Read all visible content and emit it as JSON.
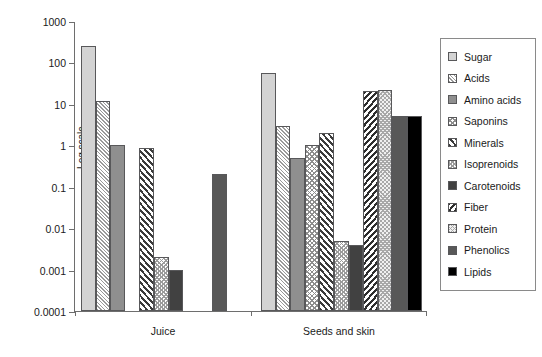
{
  "chart_data": {
    "type": "bar",
    "title": "",
    "xlabel": "",
    "ylabel": "Log scale",
    "y_scale": "log",
    "ylim": [
      0.0001,
      1000
    ],
    "y_ticks": [
      "1000",
      "100",
      "10",
      "1",
      "0.1",
      "0.01",
      "0.001",
      "0.0001"
    ],
    "y_tick_values": [
      1000,
      100,
      10,
      1,
      0.1,
      0.01,
      0.001,
      0.0001
    ],
    "grid": false,
    "legend_position": "right",
    "categories": [
      "Juice",
      "Seeds and skin"
    ],
    "series": [
      {
        "name": "Sugar",
        "pattern": "solid-light-gray",
        "values": [
          250,
          55
        ]
      },
      {
        "name": "Acids",
        "pattern": "fine-diagonal-hatch",
        "values": [
          12,
          3
        ]
      },
      {
        "name": "Amino acids",
        "pattern": "solid-medium-gray",
        "values": [
          1.0,
          0.5
        ]
      },
      {
        "name": "Saponins",
        "pattern": "fine-crosshatch",
        "values": [
          null,
          1.0
        ]
      },
      {
        "name": "Minerals",
        "pattern": "bold-diagonal-hatch",
        "values": [
          0.85,
          2.0
        ]
      },
      {
        "name": "Isoprenoids",
        "pattern": "light-crosshatch",
        "values": [
          0.002,
          0.005
        ]
      },
      {
        "name": "Carotenoids",
        "pattern": "solid-dark-gray",
        "values": [
          0.001,
          0.004
        ]
      },
      {
        "name": "Fiber",
        "pattern": "bold-back-hatch",
        "values": [
          null,
          20
        ]
      },
      {
        "name": "Protein",
        "pattern": "pale-crosshatch",
        "values": [
          null,
          22
        ]
      },
      {
        "name": "Phenolics",
        "pattern": "solid-slate-gray",
        "values": [
          0.2,
          5
        ]
      },
      {
        "name": "Lipids",
        "pattern": "solid-black",
        "values": [
          null,
          5
        ]
      }
    ]
  },
  "legend": {
    "items": [
      {
        "label": "Sugar"
      },
      {
        "label": "Acids"
      },
      {
        "label": "Amino acids"
      },
      {
        "label": "Saponins"
      },
      {
        "label": "Minerals"
      },
      {
        "label": "Isoprenoids"
      },
      {
        "label": "Carotenoids"
      },
      {
        "label": "Fiber"
      },
      {
        "label": "Protein"
      },
      {
        "label": "Phenolics"
      },
      {
        "label": "Lipids"
      }
    ]
  }
}
